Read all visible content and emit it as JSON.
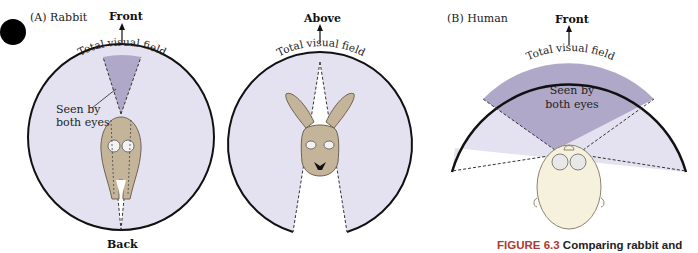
{
  "colors": {
    "field_fill": "#e4e2f0",
    "binocular_fill": "#b0a8c8",
    "outline": "#111111",
    "rabbit_fur": "#c4b49a",
    "human_skin": "#f6f1dc",
    "caption_red": "#b03a2e",
    "bullet": "#000000"
  },
  "panels": {
    "rabbit": {
      "label": "(A)  Rabbit",
      "top_view": {
        "direction_top": "Front",
        "direction_bottom": "Back",
        "arc_label": "Total visual field",
        "binocular_label_line1": "Seen by",
        "binocular_label_line2": "both eyes"
      },
      "front_view": {
        "direction_top": "Above",
        "arc_label": "Total visual field"
      }
    },
    "human": {
      "label": "(B)  Human",
      "direction_top": "Front",
      "arc_label": "Total visual field",
      "binocular_label_line1": "Seen by",
      "binocular_label_line2": "both eyes"
    }
  },
  "caption": {
    "figure_number": "FIGURE 6.3",
    "text": "Comparing rabbit and"
  }
}
